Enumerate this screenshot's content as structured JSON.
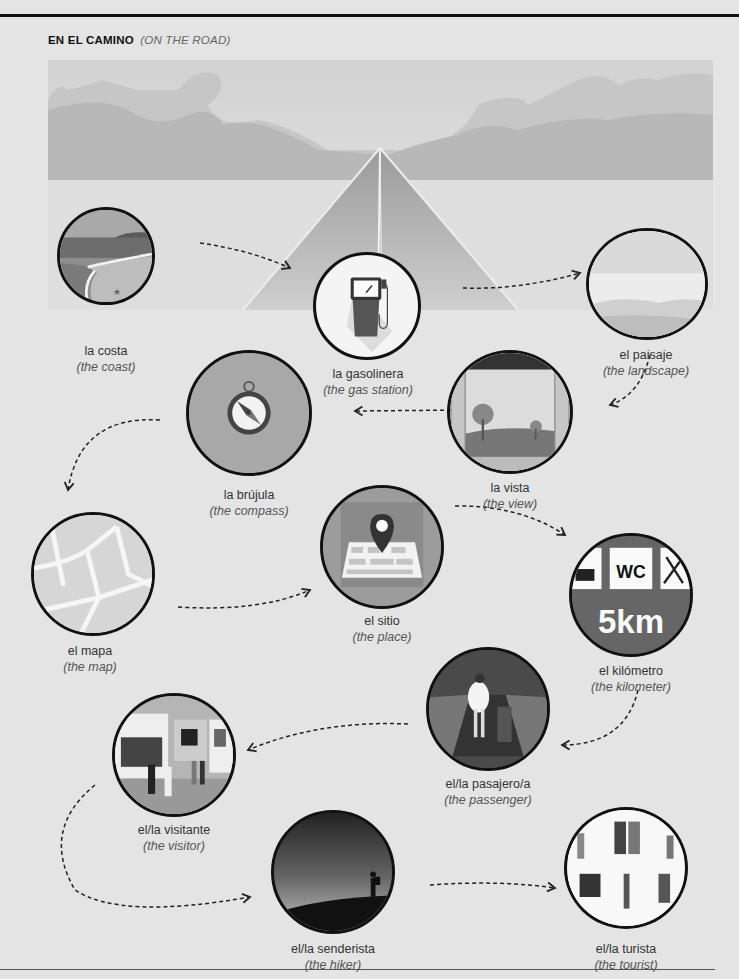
{
  "header": {
    "title": "EN EL CAMINO",
    "subtitle": "(ON THE ROAD)"
  },
  "colors": {
    "background": "#e4e4e4",
    "outline": "#111111",
    "text": "#333333",
    "italic_text": "#555555"
  },
  "vocabulary": [
    {
      "id": "costa",
      "spanish": "la costa",
      "english": "(the coast)",
      "icon": "coast-image"
    },
    {
      "id": "gasolinera",
      "spanish": "la gasolinera",
      "english": "(the gas station)",
      "icon": "gas-pump-icon"
    },
    {
      "id": "paisaje",
      "spanish": "el paisaje",
      "english": "(the landscape)",
      "icon": "landscape-image"
    },
    {
      "id": "vista",
      "spanish": "la vista",
      "english": "(the view)",
      "icon": "window-view-image"
    },
    {
      "id": "brujula",
      "spanish": "la brújula",
      "english": "(the compass)",
      "icon": "compass-icon"
    },
    {
      "id": "mapa",
      "spanish": "el mapa",
      "english": "(the map)",
      "icon": "street-map-image"
    },
    {
      "id": "sitio",
      "spanish": "el sitio",
      "english": "(the place)",
      "icon": "map-pin-icon"
    },
    {
      "id": "kilometro",
      "spanish": "el kilómetro",
      "english": "(the kilometer)",
      "icon": "road-sign-icon",
      "sign_wc": "WC",
      "sign_distance": "5km"
    },
    {
      "id": "pasajero",
      "spanish": "el/la pasajero/a",
      "english": "(the passenger)",
      "icon": "passenger-image"
    },
    {
      "id": "visitante",
      "spanish": "el/la visitante",
      "english": "(the visitor)",
      "icon": "gallery-visitors-image"
    },
    {
      "id": "senderista",
      "spanish": "el/la senderista",
      "english": "(the hiker)",
      "icon": "hiker-image"
    },
    {
      "id": "turista",
      "spanish": "el/la turista",
      "english": "(the tourist)",
      "icon": "tourists-image"
    }
  ]
}
